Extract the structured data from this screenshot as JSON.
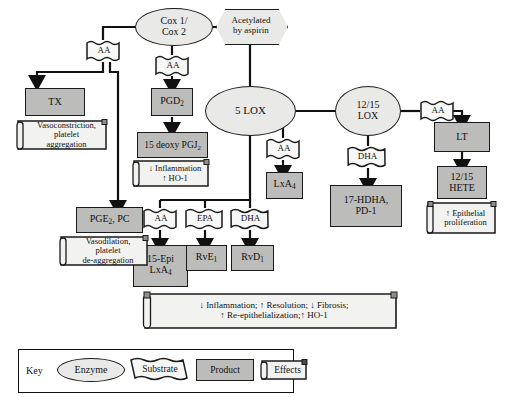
{
  "diagram": {
    "colors": {
      "enzyme_fill": "#e9e9e7",
      "product_fill": "#bcbcba",
      "effects_fill": "#f2f2f0",
      "substrate_fill": "#f7f7f5",
      "outline": "#1a1a1a",
      "background": "#ffffff"
    },
    "enzymes": [
      {
        "id": "cox",
        "label_line1": "Cox 1/",
        "label_line2": "Cox 2"
      },
      {
        "id": "lox5",
        "label_line1": "5 LOX",
        "label_line2": ""
      },
      {
        "id": "lox1215",
        "label_line1": "12/15",
        "label_line2": "LOX"
      }
    ],
    "modifiers": [
      {
        "id": "aspirin",
        "label_line1": "Acetylated",
        "label_line2": "by aspirin"
      }
    ],
    "substrates": [
      {
        "id": "aa-tx",
        "label": "AA"
      },
      {
        "id": "aa-cox",
        "label": "AA"
      },
      {
        "id": "aa-5lox",
        "label": "AA"
      },
      {
        "id": "aa-lipoxin",
        "label": "AA"
      },
      {
        "id": "epa",
        "label": "EPA"
      },
      {
        "id": "dha-5lox",
        "label": "DHA"
      },
      {
        "id": "dha-1215lox",
        "label": "DHA"
      },
      {
        "id": "aa-1215lox",
        "label": "AA"
      }
    ],
    "products": [
      {
        "id": "tx",
        "lines": [
          "TX"
        ]
      },
      {
        "id": "pgd2",
        "lines": [
          "PGD₂"
        ]
      },
      {
        "id": "deoxy-pgj2",
        "lines": [
          "15 deoxy PGJ₂"
        ]
      },
      {
        "id": "pge2-pc",
        "lines": [
          "PGE₂, PC"
        ]
      },
      {
        "id": "lxa4",
        "lines": [
          "LxA₄"
        ]
      },
      {
        "id": "epi-lxa4",
        "lines": [
          "15-Epi",
          "LxA₄"
        ]
      },
      {
        "id": "rve1",
        "lines": [
          "RvE₁"
        ]
      },
      {
        "id": "rvd1",
        "lines": [
          "RvD₁"
        ]
      },
      {
        "id": "hdha-pd1",
        "lines": [
          "17-HDHA,",
          "PD-1"
        ]
      },
      {
        "id": "lt",
        "lines": [
          "LT"
        ]
      },
      {
        "id": "hete",
        "lines": [
          "12/15",
          "HETE"
        ]
      }
    ],
    "effects": [
      {
        "id": "eff-tx",
        "lines": [
          "Vasoconstriction,",
          "platelet",
          "aggregation"
        ]
      },
      {
        "id": "eff-pgj2",
        "lines": [
          "↓ Inflammation",
          "↑ HO-1"
        ]
      },
      {
        "id": "eff-pge2",
        "lines": [
          "Vasodilation,",
          "platelet",
          "de-aggregation"
        ]
      },
      {
        "id": "eff-resolution",
        "lines": [
          "↓ Inflammation; ↑ Resolution; ↓ Fibrosis;",
          "↑ Re-epithelialization;↑ HO-1"
        ]
      },
      {
        "id": "eff-epithelial",
        "lines": [
          "↑ Epithelial",
          "proliferation"
        ]
      }
    ],
    "key": {
      "title": "Key",
      "items": [
        {
          "id": "key-enzyme",
          "label": "Enzyme",
          "shape": "ellipse"
        },
        {
          "id": "key-substrate",
          "label": "Substrate",
          "shape": "wavy-banner"
        },
        {
          "id": "key-product",
          "label": "Product",
          "shape": "rectangle"
        },
        {
          "id": "key-effects",
          "label": "Effects",
          "shape": "note"
        }
      ]
    }
  }
}
